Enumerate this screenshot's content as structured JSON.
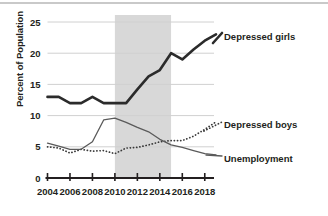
{
  "chart_data": {
    "type": "line",
    "title": "",
    "xlabel": "",
    "ylabel": "Percent of Population",
    "xlim": [
      2004,
      2019
    ],
    "ylim": [
      0,
      25
    ],
    "grid": true,
    "legend_position": "right-inline",
    "x_ticks": [
      "2004",
      "2006",
      "2008",
      "2010",
      "2012",
      "2014",
      "2016",
      "2018"
    ],
    "x_tick_values": [
      2004,
      2006,
      2008,
      2010,
      2012,
      2014,
      2016,
      2018
    ],
    "y_ticks": [
      "0",
      "5",
      "10",
      "15",
      "20",
      "25"
    ],
    "y_tick_values": [
      0,
      5,
      10,
      15,
      20,
      25
    ],
    "x": [
      2004,
      2005,
      2006,
      2007,
      2008,
      2009,
      2010,
      2011,
      2012,
      2013,
      2014,
      2015,
      2016,
      2017,
      2018,
      2019
    ],
    "shaded_region": {
      "label": "",
      "x_start": 2010,
      "x_end": 2015,
      "color": "#d8d8d8"
    },
    "series": [
      {
        "name": "Depressed girls",
        "style": "solid-thick",
        "color": "#2b2b2b",
        "values": [
          13.0,
          13.0,
          12.0,
          12.0,
          13.0,
          12.0,
          12.0,
          12.0,
          14.2,
          16.3,
          17.3,
          20.0,
          19.0,
          20.6,
          22.0,
          23.0
        ]
      },
      {
        "name": "Depressed boys",
        "style": "dotted",
        "color": "#3a3a3a",
        "values": [
          5.0,
          4.8,
          4.0,
          4.6,
          4.3,
          4.4,
          3.9,
          4.8,
          4.9,
          5.3,
          5.8,
          6.0,
          6.0,
          6.7,
          7.8,
          9.0
        ]
      },
      {
        "name": "Unemployment",
        "style": "solid-thin",
        "color": "#5a5a5a",
        "values": [
          5.6,
          5.1,
          4.6,
          4.6,
          5.8,
          9.3,
          9.6,
          8.9,
          8.1,
          7.4,
          6.2,
          5.3,
          4.9,
          4.4,
          3.9,
          3.7
        ]
      }
    ]
  },
  "labels": {
    "y_axis_title": "Percent of Population",
    "series_girls": "Depressed girls",
    "series_boys": "Depressed boys",
    "series_unemployment": "Unemployment"
  }
}
